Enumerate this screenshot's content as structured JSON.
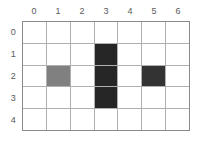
{
  "figure": {
    "background_color": "#ffffff",
    "label_color": "#595959",
    "gridline_color": "#b0b0b0",
    "border_color": "#8a8a8a"
  },
  "column_labels": [
    "0",
    "1",
    "2",
    "3",
    "4",
    "5",
    "6"
  ],
  "row_labels": [
    "0",
    "1",
    "2",
    "3",
    "4"
  ],
  "chart_data": {
    "type": "heatmap",
    "title": "",
    "xlabel": "",
    "ylabel": "",
    "categories": [
      "0",
      "1",
      "2",
      "3",
      "4",
      "5",
      "6"
    ],
    "row_categories": [
      "0",
      "1",
      "2",
      "3",
      "4"
    ],
    "grid": true,
    "legend": "none",
    "colors": {
      "empty": "#ffffff",
      "gray": "#808080",
      "dark": "#262626",
      "dark_alt": "#333333"
    },
    "cells": [
      [
        {
          "row": 0,
          "col": 0,
          "state": "empty",
          "color": "#ffffff"
        },
        {
          "row": 0,
          "col": 1,
          "state": "empty",
          "color": "#ffffff"
        },
        {
          "row": 0,
          "col": 2,
          "state": "empty",
          "color": "#ffffff"
        },
        {
          "row": 0,
          "col": 3,
          "state": "empty",
          "color": "#ffffff"
        },
        {
          "row": 0,
          "col": 4,
          "state": "empty",
          "color": "#ffffff"
        },
        {
          "row": 0,
          "col": 5,
          "state": "empty",
          "color": "#ffffff"
        },
        {
          "row": 0,
          "col": 6,
          "state": "empty",
          "color": "#ffffff"
        }
      ],
      [
        {
          "row": 1,
          "col": 0,
          "state": "empty",
          "color": "#ffffff"
        },
        {
          "row": 1,
          "col": 1,
          "state": "empty",
          "color": "#ffffff"
        },
        {
          "row": 1,
          "col": 2,
          "state": "empty",
          "color": "#ffffff"
        },
        {
          "row": 1,
          "col": 3,
          "state": "dark",
          "color": "#262626"
        },
        {
          "row": 1,
          "col": 4,
          "state": "empty",
          "color": "#ffffff"
        },
        {
          "row": 1,
          "col": 5,
          "state": "empty",
          "color": "#ffffff"
        },
        {
          "row": 1,
          "col": 6,
          "state": "empty",
          "color": "#ffffff"
        }
      ],
      [
        {
          "row": 2,
          "col": 0,
          "state": "empty",
          "color": "#ffffff"
        },
        {
          "row": 2,
          "col": 1,
          "state": "gray",
          "color": "#808080"
        },
        {
          "row": 2,
          "col": 2,
          "state": "empty",
          "color": "#ffffff"
        },
        {
          "row": 2,
          "col": 3,
          "state": "dark",
          "color": "#262626"
        },
        {
          "row": 2,
          "col": 4,
          "state": "empty",
          "color": "#ffffff"
        },
        {
          "row": 2,
          "col": 5,
          "state": "dark",
          "color": "#333333"
        },
        {
          "row": 2,
          "col": 6,
          "state": "empty",
          "color": "#ffffff"
        }
      ],
      [
        {
          "row": 3,
          "col": 0,
          "state": "empty",
          "color": "#ffffff"
        },
        {
          "row": 3,
          "col": 1,
          "state": "empty",
          "color": "#ffffff"
        },
        {
          "row": 3,
          "col": 2,
          "state": "empty",
          "color": "#ffffff"
        },
        {
          "row": 3,
          "col": 3,
          "state": "dark",
          "color": "#262626"
        },
        {
          "row": 3,
          "col": 4,
          "state": "empty",
          "color": "#ffffff"
        },
        {
          "row": 3,
          "col": 5,
          "state": "empty",
          "color": "#ffffff"
        },
        {
          "row": 3,
          "col": 6,
          "state": "empty",
          "color": "#ffffff"
        }
      ],
      [
        {
          "row": 4,
          "col": 0,
          "state": "empty",
          "color": "#ffffff"
        },
        {
          "row": 4,
          "col": 1,
          "state": "empty",
          "color": "#ffffff"
        },
        {
          "row": 4,
          "col": 2,
          "state": "empty",
          "color": "#ffffff"
        },
        {
          "row": 4,
          "col": 3,
          "state": "empty",
          "color": "#ffffff"
        },
        {
          "row": 4,
          "col": 4,
          "state": "empty",
          "color": "#ffffff"
        },
        {
          "row": 4,
          "col": 5,
          "state": "empty",
          "color": "#ffffff"
        },
        {
          "row": 4,
          "col": 6,
          "state": "empty",
          "color": "#ffffff"
        }
      ]
    ]
  }
}
